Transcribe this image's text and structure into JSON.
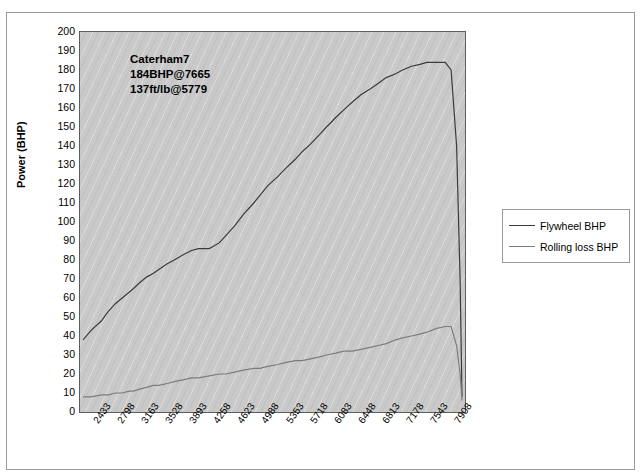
{
  "top_text": "",
  "annotation": {
    "line1": "Caterham7",
    "line2": "184BHP@7665",
    "line3": "137ft/lb@5779"
  },
  "legend": {
    "items": [
      {
        "label": "Flywheel BHP",
        "color": "#3b3b3b"
      },
      {
        "label": "Rolling loss BHP",
        "color": "#7d7d7d"
      }
    ]
  },
  "chart_data": {
    "type": "line",
    "title": "",
    "xlabel": "",
    "ylabel": "Power (BHP)",
    "ylim": [
      0,
      200
    ],
    "ytick_step": 10,
    "grid": false,
    "legend_position": "right",
    "xtick_labels": [
      "2433",
      "2798",
      "3163",
      "3528",
      "3893",
      "4258",
      "4623",
      "4988",
      "5353",
      "5718",
      "6083",
      "6448",
      "6813",
      "7178",
      "7543",
      "7908"
    ],
    "x": [
      2433,
      2550,
      2700,
      2798,
      2900,
      3000,
      3100,
      3163,
      3250,
      3350,
      3450,
      3528,
      3650,
      3750,
      3893,
      4000,
      4100,
      4258,
      4400,
      4500,
      4623,
      4750,
      4900,
      4988,
      5100,
      5250,
      5353,
      5500,
      5600,
      5718,
      5850,
      5950,
      6083,
      6200,
      6320,
      6448,
      6580,
      6700,
      6813,
      6950,
      7050,
      7178,
      7300,
      7400,
      7543,
      7665,
      7750,
      7830,
      7880,
      7908
    ],
    "series": [
      {
        "name": "Flywheel BHP",
        "color": "#3b3b3b",
        "values": [
          38,
          43,
          48,
          53,
          57,
          60,
          63,
          65,
          68,
          71,
          73,
          75,
          78,
          80,
          83,
          85,
          86,
          86,
          89,
          93,
          98,
          104,
          110,
          114,
          119,
          124,
          128,
          133,
          137,
          141,
          146,
          150,
          155,
          159,
          163,
          167,
          170,
          173,
          176,
          178,
          180,
          182,
          183,
          184,
          184,
          184,
          180,
          140,
          70,
          8
        ]
      },
      {
        "name": "Rolling loss BHP",
        "color": "#7d7d7d",
        "values": [
          8,
          8,
          9,
          9,
          10,
          10,
          11,
          11,
          12,
          13,
          14,
          14,
          15,
          16,
          17,
          18,
          18,
          19,
          20,
          20,
          21,
          22,
          23,
          23,
          24,
          25,
          26,
          27,
          27,
          28,
          29,
          30,
          31,
          32,
          32,
          33,
          34,
          35,
          36,
          38,
          39,
          40,
          41,
          42,
          44,
          45,
          45,
          35,
          20,
          6
        ]
      }
    ],
    "flywheel_peak": {
      "power": 184,
      "rpm": 7665
    },
    "torque_peak": {
      "torque": 137,
      "rpm": 5779
    }
  }
}
